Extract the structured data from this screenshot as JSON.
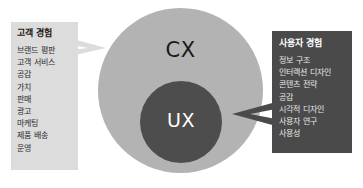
{
  "diagram": {
    "type": "venn-nested-circles",
    "circles": [
      {
        "id": "cx",
        "label": "CX",
        "fill": "#b3b3b3",
        "text_color": "#1a1a1a"
      },
      {
        "id": "ux",
        "label": "UX",
        "fill": "#4d4d4d",
        "text_color": "#ffffff"
      }
    ],
    "arrows": [
      {
        "id": "left-arrow",
        "direction": "right",
        "color": "#dcdcdc",
        "from": "left-panel",
        "to": "cx"
      },
      {
        "id": "right-arrow",
        "direction": "left",
        "color": "#4a4a4a",
        "from": "right-panel",
        "to": "ux"
      }
    ]
  },
  "left_panel": {
    "title": "고객 경험",
    "background": "#dcdcdc",
    "items": [
      "브랜드 평판",
      "고객 서비스",
      "공감",
      "가치",
      "판매",
      "광고",
      "마케팅",
      "제품 배송",
      "운영"
    ]
  },
  "right_panel": {
    "title": "사용자 경험",
    "background": "#4a4a4a",
    "items": [
      "정보 구조",
      "인터랙션 디자인",
      "콘텐츠 전략",
      "공감",
      "시각적 디자인",
      "사용자 연구",
      "사용성"
    ]
  }
}
